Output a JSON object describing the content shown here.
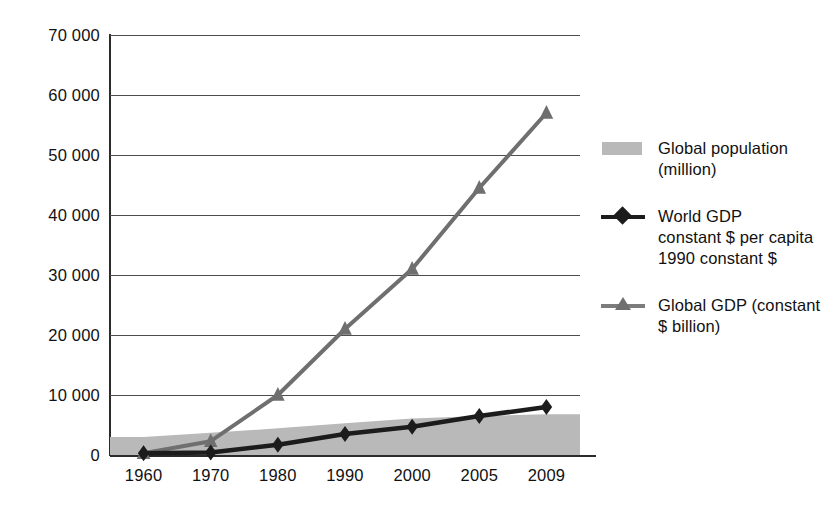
{
  "chart_data": {
    "type": "line",
    "title": "",
    "subtitle": "",
    "xlabel": "",
    "ylabel": "",
    "categories": [
      "1960",
      "1970",
      "1980",
      "1990",
      "2000",
      "2005",
      "2009"
    ],
    "ylim": [
      0,
      70000
    ],
    "ytick_values": [
      0,
      10000,
      20000,
      30000,
      40000,
      50000,
      60000,
      70000
    ],
    "ytick_labels": [
      "0",
      "10 000",
      "20 000",
      "30 000",
      "40 000",
      "50 000",
      "60 000",
      "70 000"
    ],
    "grid": true,
    "legend_position": "right",
    "series": [
      {
        "name": "Global population (million)",
        "render": "area",
        "marker": "none",
        "color": "#b9b9b9",
        "values": [
          3000,
          3700,
          4450,
          5300,
          6100,
          6500,
          6800
        ]
      },
      {
        "name": "World GDP constant $ per capita 1990 constant $",
        "render": "line",
        "marker": "diamond",
        "color": "#1c1c1c",
        "values": [
          300,
          400,
          1700,
          3500,
          4700,
          6500,
          8000
        ]
      },
      {
        "name": "Global GDP (constant $ billion)",
        "render": "line",
        "marker": "triangle",
        "color": "#6f6f6f",
        "values": [
          300,
          2300,
          10000,
          21000,
          31000,
          44500,
          57000
        ]
      }
    ]
  },
  "legend": {
    "items": [
      {
        "marker": "swatch",
        "lines": [
          "Global population",
          "(million)"
        ]
      },
      {
        "marker": "diamond-line",
        "lines": [
          "World GDP",
          "constant $ per capita",
          "1990 constant $"
        ]
      },
      {
        "marker": "triangle-line",
        "lines": [
          "Global GDP (constant",
          "$ billion)"
        ]
      }
    ]
  },
  "colors": {
    "population_area": "#b9b9b9",
    "gdp_per_capita_line": "#1c1c1c",
    "global_gdp_line": "#6f6f6f",
    "axis": "#2b2b2b",
    "gridline": "#4d4d4d",
    "background": "#ffffff"
  }
}
